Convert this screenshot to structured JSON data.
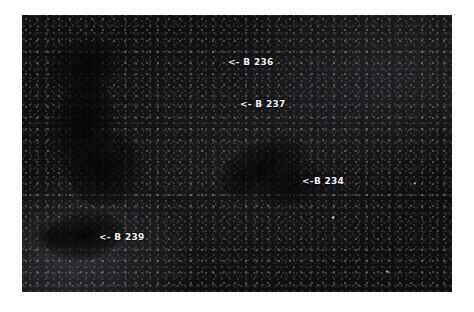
{
  "figure": {
    "kind": "astronomical-photograph",
    "background_color": "#ffffff",
    "sky_color": "#101012",
    "label_color": "#f2f2f2",
    "frame": {
      "x": 22,
      "y": 15,
      "width": 430,
      "height": 277
    }
  },
  "annotations": [
    {
      "id": "b236",
      "text": "<- B 236",
      "object": "B 236",
      "arrow": "left",
      "x": 206,
      "y": 42
    },
    {
      "id": "b237",
      "text": "<- B 237",
      "object": "B 237",
      "arrow": "left",
      "x": 218,
      "y": 84
    },
    {
      "id": "b234",
      "text": "<-B 234",
      "object": "B 234",
      "arrow": "left",
      "x": 280,
      "y": 161
    },
    {
      "id": "b239",
      "text": "<- B 239",
      "object": "B 239",
      "arrow": "left",
      "x": 77,
      "y": 217
    }
  ]
}
